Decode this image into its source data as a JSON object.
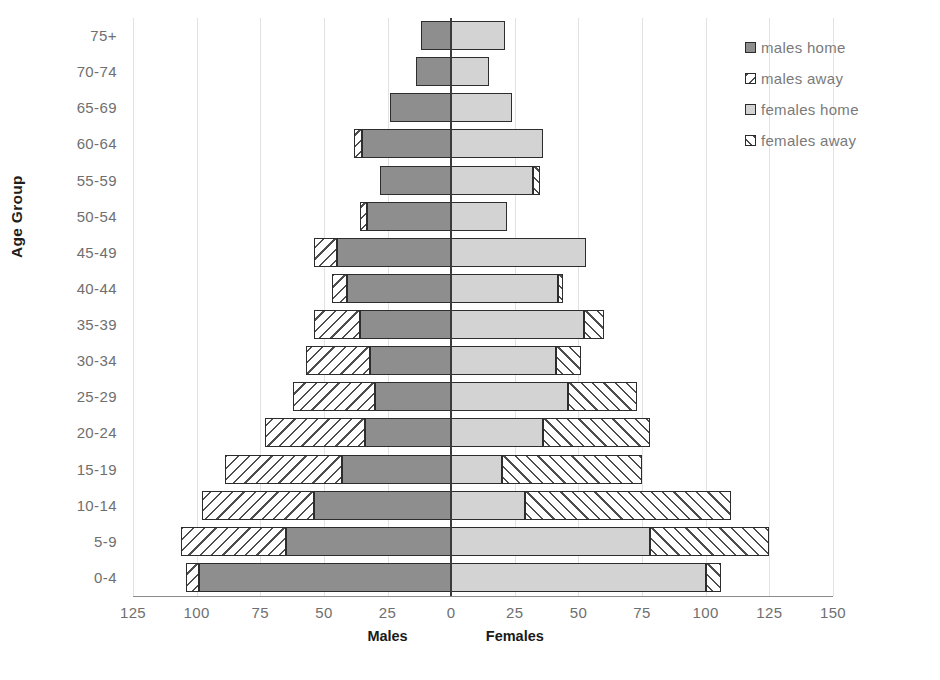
{
  "chart_data": {
    "type": "bar",
    "subtype": "population-pyramid",
    "title": "",
    "xlabel": "",
    "ylabel": "Age Group",
    "grid": true,
    "legend_position": "right",
    "axis": {
      "left_group_label": "Males",
      "right_group_label": "Females",
      "tick_labels": [
        "125",
        "100",
        "75",
        "50",
        "25",
        "0",
        "25",
        "50",
        "75",
        "100",
        "125",
        "150"
      ],
      "tick_values": [
        -125,
        -100,
        -75,
        -50,
        -25,
        0,
        25,
        50,
        75,
        100,
        125,
        150
      ],
      "xlim": [
        -125,
        150
      ],
      "tick_step": 25
    },
    "categories": [
      "75+",
      "70-74",
      "65-69",
      "60-64",
      "55-59",
      "50-54",
      "45-49",
      "40-44",
      "35-39",
      "30-34",
      "25-29",
      "20-24",
      "15-19",
      "10-14",
      "5-9",
      "0-4"
    ],
    "series": [
      {
        "name": "males home",
        "key": "males_home",
        "side": "left",
        "fill": "#8e8e8e",
        "pattern": "solid",
        "values": [
          12,
          14,
          24,
          35,
          28,
          33,
          45,
          41,
          36,
          32,
          30,
          34,
          43,
          54,
          65,
          99
        ]
      },
      {
        "name": "males away",
        "key": "males_away",
        "side": "left",
        "fill": "#f2f2f2",
        "pattern": "diagonal-back",
        "values": [
          0,
          0,
          0,
          3,
          0,
          3,
          9,
          6,
          18,
          25,
          32,
          39,
          46,
          44,
          41,
          5
        ]
      },
      {
        "name": "females home",
        "key": "females_home",
        "side": "right",
        "fill": "#d3d3d3",
        "pattern": "solid",
        "values": [
          21,
          15,
          24,
          36,
          32,
          22,
          53,
          42,
          52,
          41,
          46,
          36,
          20,
          29,
          78,
          100
        ]
      },
      {
        "name": "females away",
        "key": "females_away",
        "side": "right",
        "fill": "#f2f2f2",
        "pattern": "diagonal-fwd",
        "values": [
          0,
          0,
          0,
          0,
          3,
          0,
          0,
          2,
          8,
          10,
          27,
          42,
          55,
          81,
          47,
          6
        ]
      }
    ]
  },
  "legend": {
    "items": [
      {
        "label": "males home"
      },
      {
        "label": "males away"
      },
      {
        "label": "females home"
      },
      {
        "label": "females away"
      }
    ]
  }
}
